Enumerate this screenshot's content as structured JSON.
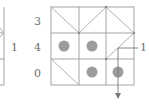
{
  "left_fragment": {
    "label": "1"
  },
  "main_grid": {
    "rows": 3,
    "cols": 3,
    "row_labels": [
      "3",
      "4",
      "0"
    ],
    "dots": [
      {
        "row": 1,
        "col": 0
      },
      {
        "row": 1,
        "col": 1
      },
      {
        "row": 2,
        "col": 1
      },
      {
        "row": 2,
        "col": 2
      }
    ],
    "pointer_label": "1"
  },
  "colors": {
    "grid": "#9a9a9a",
    "dot": "#9c9c9c",
    "text": "#6e6e6e"
  }
}
